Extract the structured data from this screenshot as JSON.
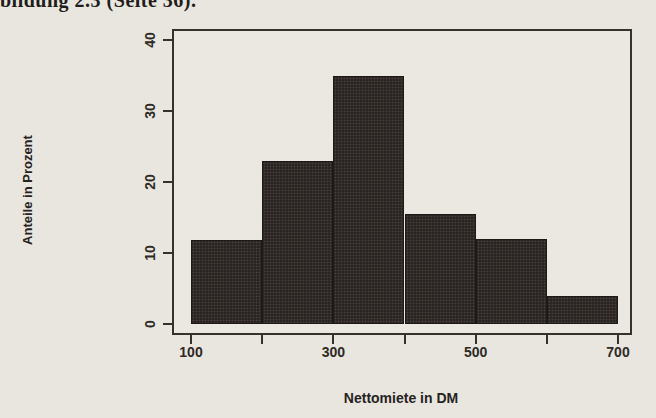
{
  "caption": {
    "text": "bildung 2.3 (Seite 36)."
  },
  "chart_data": {
    "type": "bar",
    "histogram": true,
    "title": "",
    "xlabel": "Nettomiete in DM",
    "ylabel": "Anteile in Prozent",
    "bin_edges": [
      100,
      200,
      300,
      400,
      500,
      600,
      700
    ],
    "values": [
      11.8,
      23,
      35,
      15.5,
      12,
      4
    ],
    "xlim": [
      100,
      700
    ],
    "ylim": [
      0,
      40
    ],
    "x_ticks": [
      100,
      200,
      300,
      400,
      500,
      600,
      700
    ],
    "x_tick_labels": [
      "100",
      "",
      "300",
      "",
      "500",
      "",
      "700"
    ],
    "y_ticks": [
      0,
      10,
      20,
      30,
      40
    ],
    "y_tick_labels": [
      "0",
      "10",
      "20",
      "30",
      "40"
    ],
    "grid": false,
    "legend": "none",
    "bar_color": "#2a2523",
    "axis_color": "#35312c"
  }
}
